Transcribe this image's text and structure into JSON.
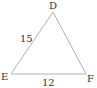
{
  "diagram": {
    "type": "triangle",
    "vertices": [
      {
        "name": "D",
        "x": 53,
        "y": 12
      },
      {
        "name": "E",
        "x": 11,
        "y": 74
      },
      {
        "name": "F",
        "x": 86,
        "y": 74
      }
    ],
    "sides": [
      {
        "from": "D",
        "to": "E",
        "label": "15"
      },
      {
        "from": "E",
        "to": "F",
        "label": "12"
      }
    ],
    "stroke_color": "#b0b0b0",
    "label_color": "#333333"
  },
  "labels": {
    "D": "D",
    "E": "E",
    "F": "F",
    "DE": "15",
    "EF": "12"
  }
}
